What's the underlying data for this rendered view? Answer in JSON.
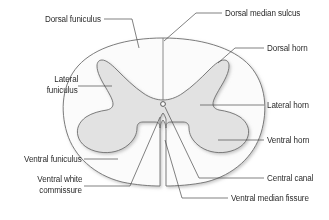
{
  "figure": {
    "colors": {
      "gray_matter_fill": "#e2e2e2",
      "white_matter_fill": "#fbfbfb",
      "outline": "#6e6e6e",
      "leader_line": "#4a4a4a",
      "text": "#2b2b2b",
      "background": "#ffffff"
    }
  },
  "labels": {
    "dorsal_funiculus": "Dorsal funiculus",
    "lateral_funiculus_line1": "Lateral",
    "lateral_funiculus_line2": "funiculus",
    "ventral_funiculus": "Ventral funiculus",
    "ventral_white_commissure_line1": "Ventral white",
    "ventral_white_commissure_line2": "commissure",
    "dorsal_median_sulcus": "Dorsal median sulcus",
    "dorsal_horn": "Dorsal horn",
    "lateral_horn": "Lateral horn",
    "ventral_horn": "Ventral horn",
    "central_canal": "Central canal",
    "ventral_median_fissure": "Ventral median fissure"
  }
}
